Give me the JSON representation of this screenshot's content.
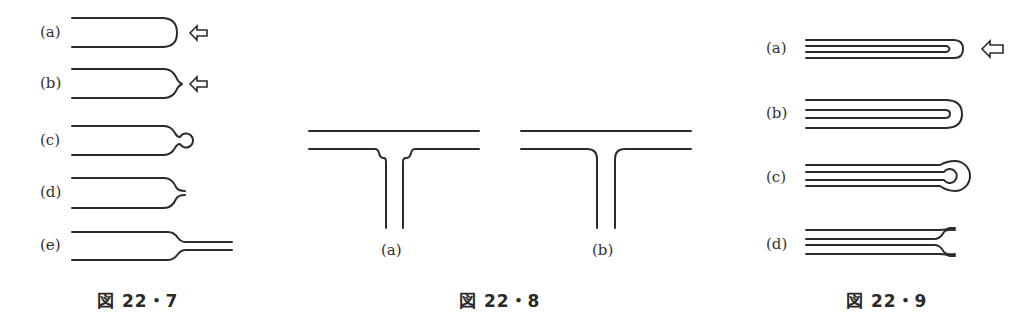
{
  "figures": [
    {
      "caption": "図 22・7",
      "labels": [
        "(a)",
        "(b)",
        "(c)",
        "(d)",
        "(e)"
      ],
      "arrow_icon": "hollow-left-arrow"
    },
    {
      "caption": "図 22・8",
      "labels": [
        "(a)",
        "(b)"
      ]
    },
    {
      "caption": "図 22・9",
      "labels": [
        "(a)",
        "(b)",
        "(c)",
        "(d)"
      ],
      "arrow_icon": "hollow-left-arrow"
    }
  ]
}
